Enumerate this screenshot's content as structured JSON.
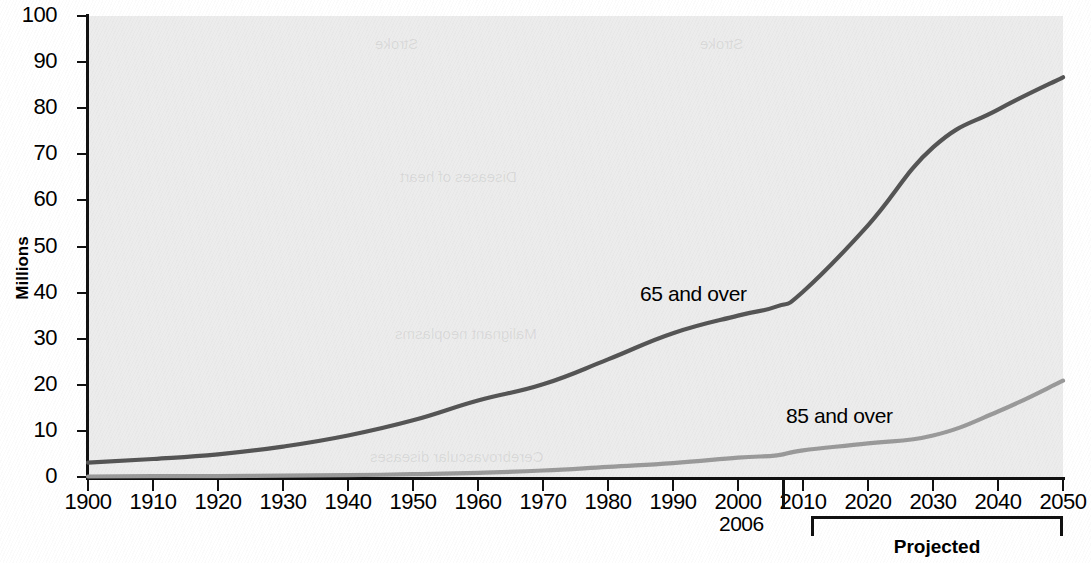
{
  "chart_data": {
    "type": "line",
    "title": "",
    "xlabel": "",
    "ylabel": "Millions",
    "xlim": [
      1900,
      2050
    ],
    "ylim": [
      0,
      100
    ],
    "grid": false,
    "legend_position": "inline-annotation",
    "x_ticks": [
      "1900",
      "1910",
      "1920",
      "1930",
      "1940",
      "1950",
      "1960",
      "1970",
      "1980",
      "1990",
      "2000",
      "2010",
      "2020",
      "2030",
      "2040",
      "2050"
    ],
    "x_tick_values": [
      1900,
      1910,
      1920,
      1930,
      1940,
      1950,
      1960,
      1970,
      1980,
      1990,
      2000,
      2010,
      2020,
      2030,
      2040,
      2050
    ],
    "y_ticks": [
      "0",
      "10",
      "20",
      "30",
      "40",
      "50",
      "60",
      "70",
      "80",
      "90",
      "100"
    ],
    "y_tick_values": [
      0,
      10,
      20,
      30,
      40,
      50,
      60,
      70,
      80,
      90,
      100
    ],
    "x": [
      1900,
      1910,
      1920,
      1930,
      1940,
      1950,
      1960,
      1970,
      1980,
      1990,
      2000,
      2006,
      2010,
      2020,
      2030,
      2040,
      2050
    ],
    "series": [
      {
        "name": "65 and over",
        "color": "#555555",
        "values": [
          3.1,
          3.9,
          4.9,
          6.6,
          9.0,
          12.3,
          16.6,
          20.1,
          25.5,
          31.2,
          35.0,
          37.0,
          40.2,
          54.6,
          71.5,
          79.7,
          86.7
        ]
      },
      {
        "name": "85 and over",
        "color": "#9a9a9a",
        "values": [
          0.1,
          0.2,
          0.2,
          0.3,
          0.4,
          0.6,
          0.9,
          1.4,
          2.2,
          3.0,
          4.2,
          4.7,
          5.8,
          7.3,
          9.0,
          14.2,
          20.9
        ]
      }
    ],
    "annotations": [
      {
        "name": "2006-marker",
        "label": "2006",
        "x_value": 2006
      },
      {
        "name": "projected-bracket",
        "label": "Projected",
        "x_start": 2006,
        "x_end": 2050
      }
    ],
    "ghost_text": [
      "Stroke",
      "Diseases of heart",
      "Malignant neoplasms",
      "Cerebrovascular diseases"
    ],
    "colors": {
      "plot_background": "#ececec",
      "page_background": "#ffffff",
      "axis": "#111111",
      "series_65": "#555555",
      "series_85": "#9a9a9a"
    }
  }
}
